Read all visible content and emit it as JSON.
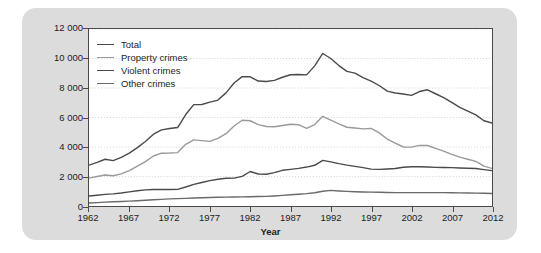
{
  "chart_data": {
    "type": "line",
    "title": "",
    "xlabel": "Year",
    "ylabel": "Rate per 100 000 population",
    "xlim": [
      1962,
      2012
    ],
    "ylim": [
      0,
      12000
    ],
    "ytick_labels": [
      "12 000",
      "10 000",
      "8 000",
      "6 000",
      "4 000",
      "2 000",
      "0"
    ],
    "ytick_values": [
      12000,
      10000,
      8000,
      6000,
      4000,
      2000,
      0
    ],
    "xtick_labels": [
      "1962",
      "1967",
      "1972",
      "1977",
      "1982",
      "1987",
      "1992",
      "1997",
      "2002",
      "2007",
      "2012"
    ],
    "xtick_values": [
      1962,
      1967,
      1972,
      1977,
      1982,
      1987,
      1992,
      1997,
      2002,
      2007,
      2012
    ],
    "grid": "horizontal-dotted",
    "legend_position": "upper-left",
    "x": [
      1962,
      1963,
      1964,
      1965,
      1966,
      1967,
      1968,
      1969,
      1970,
      1971,
      1972,
      1973,
      1974,
      1975,
      1976,
      1977,
      1978,
      1979,
      1980,
      1981,
      1982,
      1983,
      1984,
      1985,
      1986,
      1987,
      1988,
      1989,
      1990,
      1991,
      1992,
      1993,
      1994,
      1995,
      1996,
      1997,
      1998,
      1999,
      2000,
      2001,
      2002,
      2003,
      2004,
      2005,
      2006,
      2007,
      2008,
      2009,
      2010,
      2011,
      2012
    ],
    "series": [
      {
        "name": "Total",
        "color": "#4a4a4a",
        "values": [
          2771,
          2960,
          3170,
          3080,
          3290,
          3580,
          3960,
          4370,
          4870,
          5160,
          5250,
          5320,
          6200,
          6870,
          6880,
          7040,
          7180,
          7670,
          8340,
          8770,
          8760,
          8470,
          8440,
          8520,
          8730,
          8900,
          8920,
          8890,
          9500,
          10340,
          10000,
          9520,
          9130,
          9010,
          8710,
          8470,
          8170,
          7790,
          7660,
          7590,
          7500,
          7760,
          7880,
          7610,
          7350,
          7020,
          6690,
          6430,
          6180,
          5780,
          5630
        ]
      },
      {
        "name": "Property crimes",
        "color": "#9a9a9a",
        "values": [
          1891,
          2000,
          2100,
          2050,
          2180,
          2400,
          2700,
          3010,
          3390,
          3580,
          3590,
          3620,
          4180,
          4480,
          4430,
          4380,
          4580,
          4900,
          5420,
          5810,
          5780,
          5520,
          5390,
          5370,
          5460,
          5540,
          5510,
          5270,
          5520,
          6080,
          5830,
          5570,
          5340,
          5290,
          5230,
          5260,
          4960,
          4540,
          4260,
          4000,
          3990,
          4110,
          4100,
          3910,
          3720,
          3500,
          3310,
          3170,
          3030,
          2700,
          2550
        ]
      },
      {
        "name": "Violent crimes",
        "color": "#4a4a4a",
        "values": [
          680,
          730,
          790,
          820,
          880,
          960,
          1030,
          1090,
          1120,
          1120,
          1120,
          1130,
          1290,
          1470,
          1590,
          1720,
          1810,
          1880,
          1890,
          2010,
          2340,
          2170,
          2150,
          2260,
          2420,
          2480,
          2550,
          2640,
          2760,
          3090,
          2990,
          2870,
          2770,
          2690,
          2600,
          2500,
          2480,
          2510,
          2540,
          2630,
          2660,
          2660,
          2640,
          2620,
          2610,
          2600,
          2580,
          2560,
          2540,
          2470,
          2400
        ]
      },
      {
        "name": "Other crimes",
        "color": "#6a6a6a",
        "values": [
          200,
          230,
          260,
          290,
          310,
          330,
          360,
          390,
          420,
          450,
          480,
          500,
          520,
          540,
          560,
          580,
          590,
          600,
          610,
          620,
          630,
          640,
          650,
          680,
          720,
          760,
          800,
          840,
          900,
          1000,
          1060,
          1020,
          990,
          970,
          950,
          940,
          930,
          920,
          910,
          910,
          910,
          910,
          910,
          910,
          910,
          900,
          890,
          880,
          870,
          860,
          850
        ]
      }
    ]
  },
  "legend": {
    "items": [
      {
        "label": "Total"
      },
      {
        "label": "Property crimes"
      },
      {
        "label": "Violent crimes"
      },
      {
        "label": "Other crimes"
      }
    ]
  },
  "colors": {
    "panel_background": "#dcdcdc",
    "plot_background": "#ffffff",
    "axis": "#4a4a4a",
    "grid": "#c8c8c8",
    "text": "#1c1c1c"
  }
}
